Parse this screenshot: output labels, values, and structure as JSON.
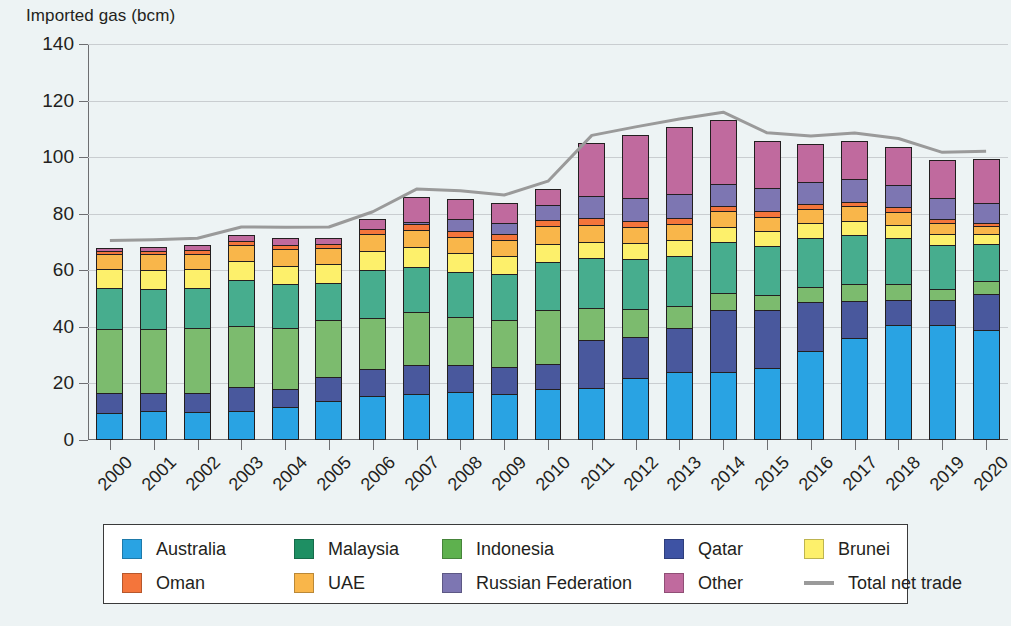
{
  "chart_data": {
    "type": "bar",
    "stacked": true,
    "title": "",
    "ylabel": "Imported gas (bcm)",
    "xlabel": "",
    "ylim": [
      0,
      140
    ],
    "yticks": [
      0,
      20,
      40,
      60,
      80,
      100,
      120,
      140
    ],
    "grid": true,
    "legend_position": "bottom",
    "categories": [
      "2000",
      "2001",
      "2002",
      "2003",
      "2004",
      "2005",
      "2006",
      "2007",
      "2008",
      "2009",
      "2010",
      "2011",
      "2012",
      "2013",
      "2014",
      "2015",
      "2016",
      "2017",
      "2018",
      "2019",
      "2020"
    ],
    "series": [
      {
        "name": "Australia",
        "color": "#29a3e3",
        "values": [
          9.7,
          10.1,
          9.9,
          10.4,
          11.5,
          13.8,
          15.5,
          16.4,
          16.8,
          16.3,
          17.9,
          18.4,
          22.1,
          24.2,
          24.2,
          25.5,
          31.5,
          36.0,
          40.6,
          40.8,
          39.0
        ]
      },
      {
        "name": "Qatar",
        "color": "#49589d",
        "values": [
          7.4,
          7.0,
          7.1,
          8.6,
          7.0,
          8.9,
          9.9,
          10.4,
          10.0,
          10.0,
          9.5,
          17.3,
          14.7,
          15.6,
          22.1,
          20.8,
          17.8,
          13.6,
          9.2,
          8.9,
          12.8
        ]
      },
      {
        "name": "Indonesia",
        "color": "#7cbb6e",
        "values": [
          23.0,
          22.8,
          23.2,
          22.2,
          21.8,
          20.4,
          18.6,
          19.3,
          17.3,
          16.9,
          19.3,
          11.6,
          10.3,
          8.3,
          6.4,
          5.8,
          5.6,
          6.3,
          6.2,
          4.3,
          5.0
        ]
      },
      {
        "name": "Malaysia",
        "color": "#47ad8e",
        "values": [
          14.7,
          14.5,
          14.5,
          16.3,
          15.8,
          13.6,
          17.0,
          16.3,
          16.3,
          16.5,
          17.4,
          18.0,
          17.8,
          17.9,
          18.3,
          17.7,
          17.6,
          17.8,
          16.4,
          15.9,
          13.5
        ]
      },
      {
        "name": "Brunei",
        "color": "#fdf06b",
        "values": [
          7.1,
          7.2,
          7.1,
          7.1,
          7.0,
          6.9,
          7.2,
          7.4,
          7.0,
          6.9,
          6.8,
          6.3,
          6.2,
          6.2,
          5.8,
          5.4,
          5.5,
          5.3,
          4.9,
          4.2,
          4.0
        ]
      },
      {
        "name": "UAE",
        "color": "#f9b64a",
        "values": [
          5.8,
          5.8,
          5.8,
          6.0,
          6.3,
          6.2,
          6.3,
          6.2,
          6.1,
          6.0,
          6.4,
          6.3,
          6.0,
          6.0,
          5.9,
          5.6,
          5.4,
          5.4,
          5.1,
          4.4,
          3.2
        ]
      },
      {
        "name": "Oman",
        "color": "#f4753b",
        "values": [
          1.2,
          1.6,
          1.7,
          1.8,
          1.8,
          1.7,
          2.4,
          2.5,
          2.4,
          2.3,
          2.6,
          2.6,
          2.3,
          2.4,
          2.2,
          2.3,
          2.0,
          2.0,
          2.0,
          1.6,
          1.3
        ]
      },
      {
        "name": "Russian Federation",
        "color": "#7d76b2",
        "values": [
          0.0,
          0.0,
          0.0,
          0.0,
          0.0,
          0.0,
          0.0,
          1.0,
          4.6,
          4.4,
          5.7,
          8.1,
          8.5,
          9.0,
          8.2,
          8.5,
          8.4,
          8.4,
          8.3,
          8.1,
          7.6
        ]
      },
      {
        "name": "Other",
        "color": "#c06a9e",
        "values": [
          1.6,
          1.8,
          2.0,
          2.5,
          2.6,
          2.4,
          3.8,
          9.2,
          7.6,
          7.3,
          5.9,
          19.1,
          22.8,
          23.9,
          22.8,
          17.0,
          13.7,
          13.7,
          13.9,
          13.5,
          15.7
        ]
      }
    ],
    "line_series": {
      "name": "Total net trade",
      "color": "#9a9a9a",
      "values": [
        70.5,
        70.8,
        71.3,
        75.3,
        75.2,
        75.3,
        80.7,
        88.7,
        88.1,
        86.6,
        91.5,
        107.7,
        110.7,
        113.5,
        115.9,
        108.6,
        107.5,
        108.5,
        106.6,
        101.7,
        102.1
      ]
    }
  },
  "axis": {
    "y_title": "Imported gas (bcm)"
  },
  "legend": {
    "row1": [
      {
        "label": "Australia",
        "key": "australia"
      },
      {
        "label": "Malaysia",
        "key": "malaysia"
      },
      {
        "label": "Indonesia",
        "key": "indonesia"
      },
      {
        "label": "Qatar",
        "key": "qatar"
      },
      {
        "label": "Brunei",
        "key": "brunei"
      }
    ],
    "row2": [
      {
        "label": "Oman",
        "key": "oman"
      },
      {
        "label": "UAE",
        "key": "uae"
      },
      {
        "label": "Russian Federation",
        "key": "russian-federation"
      },
      {
        "label": "Other",
        "key": "other"
      },
      {
        "label": "Total net trade",
        "key": "total-net-trade"
      }
    ]
  },
  "colors": {
    "background": "#edf3f4",
    "axis": "#6d6e71",
    "grid": "#c9cdd0",
    "bar_outline": "#231f20",
    "legend_border": "#3a3a3a",
    "australia": "#29a3e3",
    "malaysia": "#1e8f63",
    "indonesia": "#5eb14e",
    "qatar": "#3e53a4",
    "brunei": "#fdf06b",
    "oman": "#f4753b",
    "uae": "#f9b64a",
    "russian-federation": "#7d76b2",
    "other": "#c06a9e",
    "total-net-trade": "#9a9a9a"
  }
}
